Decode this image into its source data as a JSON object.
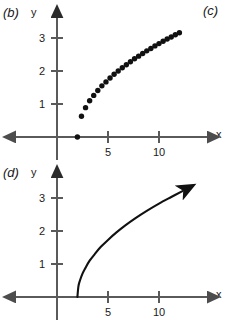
{
  "panels": {
    "b": {
      "label": "(b)",
      "x_axis_name": "x",
      "y_axis_name": "y"
    },
    "c": {
      "label": "(c)"
    },
    "d": {
      "label": "(d)",
      "x_axis_name": "x",
      "y_axis_name": "y"
    }
  },
  "chart_data": [
    {
      "type": "scatter",
      "title": "(b)",
      "xlabel": "x",
      "ylabel": "y",
      "xlim": [
        -1,
        14
      ],
      "ylim": [
        -0.6,
        3.7
      ],
      "xticks": [
        5,
        10
      ],
      "xtick_labels": [
        "5",
        "10"
      ],
      "yticks": [
        1,
        2,
        3
      ],
      "ytick_labels": [
        "1",
        "2",
        "3"
      ],
      "grid": false,
      "legend": "none",
      "function": "y = sqrt(x - 2)",
      "x": [
        2.0,
        2.4,
        2.8,
        3.2,
        3.6,
        4.0,
        4.4,
        4.8,
        5.2,
        5.6,
        6.0,
        6.4,
        6.8,
        7.2,
        7.6,
        8.0,
        8.4,
        8.8,
        9.2,
        9.6,
        10.0,
        10.4,
        10.8,
        11.2,
        11.6,
        12.0
      ],
      "y": [
        0.0,
        0.63,
        0.89,
        1.1,
        1.26,
        1.41,
        1.55,
        1.67,
        1.79,
        1.9,
        2.0,
        2.1,
        2.19,
        2.28,
        2.37,
        2.45,
        2.53,
        2.61,
        2.68,
        2.76,
        2.83,
        2.9,
        2.97,
        3.03,
        3.1,
        3.16
      ]
    },
    {
      "type": "line",
      "title": "(d)",
      "xlabel": "x",
      "ylabel": "y",
      "xlim": [
        -1,
        14
      ],
      "ylim": [
        -0.6,
        3.7
      ],
      "xticks": [
        5,
        10
      ],
      "xtick_labels": [
        "5",
        "10"
      ],
      "yticks": [
        1,
        2,
        3
      ],
      "ytick_labels": [
        "1",
        "2",
        "3"
      ],
      "grid": false,
      "legend": "none",
      "function": "y = sqrt(x - 2)",
      "arrow_end": true,
      "x": [
        2.0,
        2.1,
        2.25,
        2.5,
        2.8,
        3.2,
        3.7,
        4.3,
        5.0,
        5.8,
        6.7,
        7.7,
        8.8,
        10.0,
        11.2,
        12.3
      ],
      "y": [
        0.0,
        0.32,
        0.5,
        0.71,
        0.89,
        1.1,
        1.3,
        1.52,
        1.73,
        1.95,
        2.17,
        2.39,
        2.61,
        2.83,
        3.03,
        3.21
      ]
    }
  ],
  "colors": {
    "ink": "#1a1a1a",
    "axis": "#5a5a5a",
    "marker": "#111111"
  }
}
